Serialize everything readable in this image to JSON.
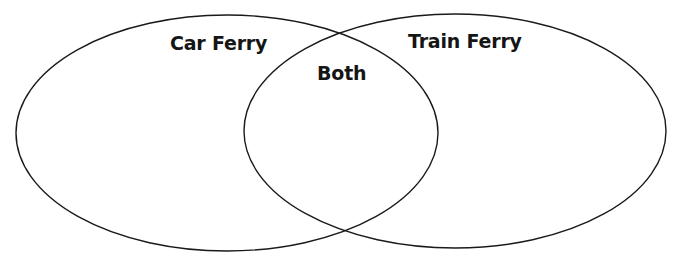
{
  "diagram": {
    "type": "venn",
    "sets": [
      {
        "id": "left",
        "label": "Car Ferry",
        "shape": "ellipse",
        "cx": 227,
        "cy": 133,
        "rx": 211,
        "ry": 118
      },
      {
        "id": "right",
        "label": "Train Ferry",
        "shape": "ellipse",
        "cx": 455,
        "cy": 131,
        "rx": 211,
        "ry": 117
      }
    ],
    "intersection": {
      "label": "Both"
    },
    "colors": {
      "stroke": "#1a1a1a",
      "background": "#ffffff",
      "text": "#151515"
    }
  }
}
